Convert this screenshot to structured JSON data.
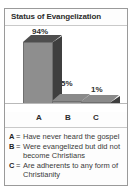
{
  "chart_data": {
    "type": "bar",
    "title": "Status of Evangelization",
    "categories": [
      "A",
      "B",
      "C"
    ],
    "values": [
      94,
      5,
      1
    ],
    "value_labels": [
      "94%",
      "5%",
      "1%"
    ],
    "xlabel": "",
    "ylabel": "",
    "ylim": [
      0,
      100
    ],
    "grid": false,
    "legend_position": "below",
    "legend": [
      {
        "key": "A",
        "separator": "=",
        "text": "Have never heard the gospel"
      },
      {
        "key": "B",
        "separator": "=",
        "text": "Were evangelized but did not become Christians"
      },
      {
        "key": "C",
        "separator": "=",
        "text": "Are adherents to any form of Christianity"
      }
    ],
    "colors": {
      "bar_front": "#8e8e8e",
      "bar_top": "#4e4e4e",
      "bar_side": "#3f3f3f",
      "text": "#2c2c2c",
      "frame": "#9a9a9a",
      "background": "#ffffff"
    }
  }
}
